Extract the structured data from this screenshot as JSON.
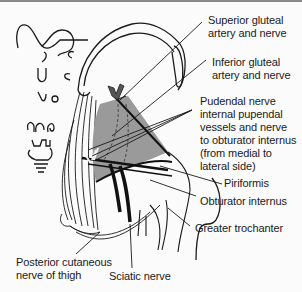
{
  "diagram": {
    "colors": {
      "muscle_fill": "#9a9a9a",
      "line": "#1a1a1a",
      "nerve": "#111111",
      "background": "#fbfbfb",
      "artery_mark": "#555555"
    },
    "labels": {
      "superior_gluteal": "Superior gluteal\nartery and nerve",
      "inferior_gluteal": "Inferior gluteal\nartery and nerve",
      "pudendal": "Pudendal nerve\ninternal pupendal\nvessels and nerve\nto obturator internus\n(from medial to\nlateral side)",
      "piriformis": "Piriformis",
      "obturator_internus": "Obturator internus",
      "greater_trochanter": "Greater trochanter",
      "posterior_cutaneous": "Posterior cutaneous\nnerve of thigh",
      "sciatic": "Sciatic nerve"
    }
  }
}
